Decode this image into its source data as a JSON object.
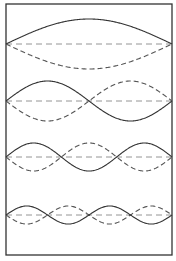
{
  "figure": {
    "frame": {
      "x": 6,
      "y": 4,
      "width": 166,
      "height": 251
    },
    "colors": {
      "frame": "#333333",
      "solid": "#333333",
      "dashed": "#555555",
      "axis": "#888888"
    },
    "modes": [
      {
        "n": 1,
        "baseline_y": 44,
        "amplitude": 25
      },
      {
        "n": 2,
        "baseline_y": 101,
        "amplitude": 20
      },
      {
        "n": 3,
        "baseline_y": 157,
        "amplitude": 14
      },
      {
        "n": 4,
        "baseline_y": 215,
        "amplitude": 9
      }
    ]
  }
}
